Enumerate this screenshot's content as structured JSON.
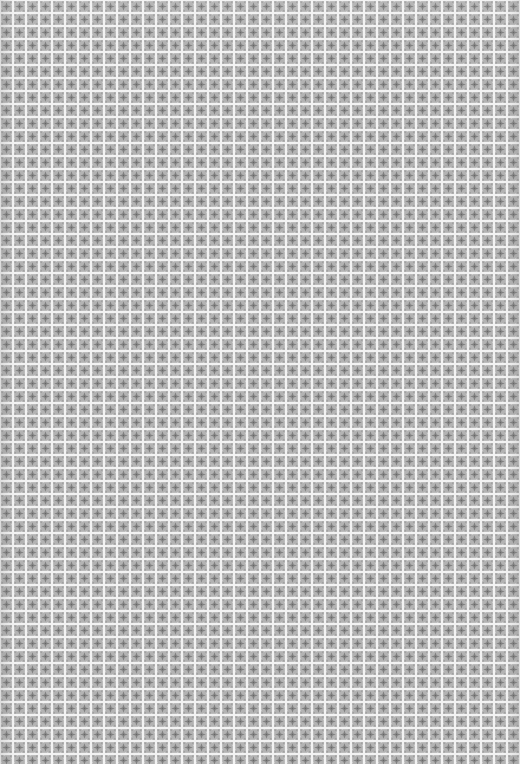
{
  "image": {
    "description": "Seamless grey tiled texture of small square tiles with a four-point star motif separated by light grid lines",
    "tile_size_px": 13,
    "grout_width_px": 2,
    "columns": 40,
    "rows": 59
  },
  "colors": {
    "grout": "#f2f2f2",
    "tile_base": "#bdbdbd",
    "tile_shade": "#a8a8a8",
    "motif": "#7e7e7e",
    "motif_dark": "#6a6a6a",
    "corner_dot": "#8c8c8c"
  }
}
